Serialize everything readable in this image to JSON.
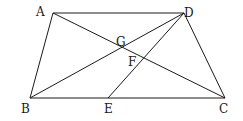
{
  "diagram": {
    "type": "geometry",
    "points": {
      "A": {
        "label": "A",
        "x": 53,
        "y": 13,
        "lx": 36,
        "ly": 16
      },
      "D": {
        "label": "D",
        "x": 184,
        "y": 13,
        "lx": 184,
        "ly": 17
      },
      "B": {
        "label": "B",
        "x": 30,
        "y": 98,
        "lx": 21,
        "ly": 113
      },
      "C": {
        "label": "C",
        "x": 225,
        "y": 98,
        "lx": 219,
        "ly": 113
      },
      "E": {
        "label": "E",
        "x": 108,
        "y": 98,
        "lx": 104,
        "ly": 113
      },
      "G": {
        "label": "G",
        "x": 121,
        "y": 47,
        "lx": 116,
        "ly": 46
      },
      "F": {
        "label": "F",
        "x": 143,
        "y": 59,
        "lx": 128,
        "ly": 66
      }
    },
    "segments": [
      "AD",
      "AB",
      "BC",
      "DC",
      "AC",
      "BD",
      "DE"
    ]
  }
}
